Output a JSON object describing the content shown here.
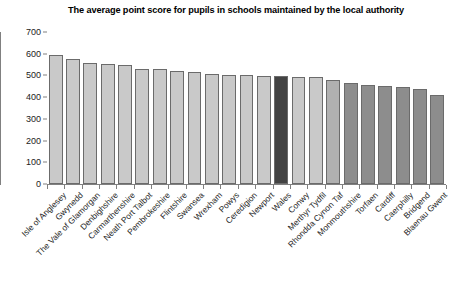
{
  "chart_data": {
    "type": "bar",
    "title": "The average point score for pupils in schools maintained by the local authority",
    "xlabel": "",
    "ylabel": "",
    "ylim": [
      0,
      700
    ],
    "ytick_step": 100,
    "yticks": [
      700,
      600,
      500,
      400,
      300,
      200,
      100,
      0
    ],
    "grid": false,
    "legend": "none",
    "categories": [
      "Isle of Anglesey",
      "Gwynedd",
      "The Vale of Glamorgan",
      "Denbighshire",
      "Carmarthenshire",
      "Neath Port Talbot",
      "Pembrokeshire",
      "Flintshire",
      "Swansea",
      "Wrexham",
      "Powys",
      "Ceredigion",
      "Newport",
      "Wales",
      "Conwy",
      "Merthyr Tydfil",
      "Rhondda Cynon Taf",
      "Monmouthshire",
      "Torfaen",
      "Cardiff",
      "Caerphilly",
      "Bridgend",
      "Blaenau Gwent"
    ],
    "values": [
      594,
      577,
      556,
      551,
      546,
      531,
      530,
      521,
      517,
      506,
      503,
      500,
      499,
      497,
      494,
      492,
      478,
      465,
      455,
      450,
      448,
      437,
      410
    ],
    "bar_colors": [
      "#c9c9c9",
      "#c9c9c9",
      "#c9c9c9",
      "#c9c9c9",
      "#c9c9c9",
      "#c9c9c9",
      "#c9c9c9",
      "#c9c9c9",
      "#c9c9c9",
      "#c9c9c9",
      "#c9c9c9",
      "#c9c9c9",
      "#c9c9c9",
      "#434343",
      "#c9c9c9",
      "#c9c9c9",
      "#b0b0b0",
      "#8d8d8d",
      "#8d8d8d",
      "#8d8d8d",
      "#8d8d8d",
      "#8d8d8d",
      "#8d8d8d"
    ],
    "highlight_category": "Wales",
    "highlight_color": "#434343",
    "default_bar_color": "#c9c9c9",
    "bar_border_color": "#6b6b6b",
    "axis_color": "#808080"
  }
}
